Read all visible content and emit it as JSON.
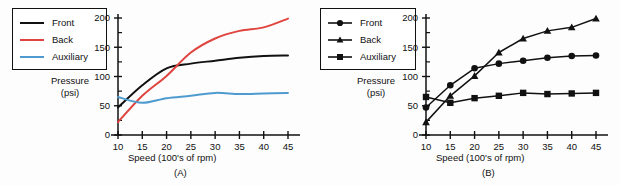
{
  "figure": {
    "background_color": "#fdfdfd",
    "panels": [
      {
        "id": "A",
        "caption": "(A)",
        "style": "colored-lines"
      },
      {
        "id": "B",
        "caption": "(B)",
        "style": "black-lines-with-markers"
      }
    ]
  },
  "chart_data": [
    {
      "type": "line",
      "panel": "A",
      "title": "",
      "caption": "(A)",
      "xlabel": "Speed (100's of rpm)",
      "ylabel": "Pressure (psi)",
      "ylabel_line1": "Pressure",
      "ylabel_line2": "(psi)",
      "x": [
        10,
        15,
        20,
        25,
        30,
        35,
        40,
        45
      ],
      "xticks": [
        "10",
        "15",
        "20",
        "25",
        "30",
        "35",
        "40",
        "45"
      ],
      "yticks": [
        "0",
        "50",
        "100",
        "150",
        "200"
      ],
      "xlim": [
        10,
        45
      ],
      "ylim": [
        0,
        200
      ],
      "grid": false,
      "legend_position": "outside-left",
      "series": [
        {
          "name": "Front",
          "values": [
            47,
            85,
            114,
            122,
            127,
            132,
            135,
            136
          ],
          "color": "#111111",
          "marker": "none"
        },
        {
          "name": "Back",
          "values": [
            22,
            67,
            101,
            141,
            165,
            178,
            184,
            199
          ],
          "color": "#E0443F",
          "marker": "none"
        },
        {
          "name": "Auxiliary",
          "values": [
            65,
            55,
            63,
            67,
            72,
            70,
            71,
            72
          ],
          "color": "#4E9BD0",
          "marker": "none"
        }
      ]
    },
    {
      "type": "line",
      "panel": "B",
      "title": "",
      "caption": "(B)",
      "xlabel": "Speed (100's of rpm)",
      "ylabel": "Pressure (psi)",
      "ylabel_line1": "Pressure",
      "ylabel_line2": "(psi)",
      "x": [
        10,
        15,
        20,
        25,
        30,
        35,
        40,
        45
      ],
      "xticks": [
        "10",
        "15",
        "20",
        "25",
        "30",
        "35",
        "40",
        "45"
      ],
      "yticks": [
        "0",
        "50",
        "100",
        "150",
        "200"
      ],
      "xlim": [
        10,
        45
      ],
      "ylim": [
        0,
        200
      ],
      "grid": false,
      "legend_position": "outside-left",
      "series": [
        {
          "name": "Front",
          "values": [
            47,
            85,
            114,
            122,
            127,
            132,
            135,
            136
          ],
          "color": "#111111",
          "marker": "circle"
        },
        {
          "name": "Back",
          "values": [
            22,
            67,
            101,
            141,
            165,
            178,
            184,
            199
          ],
          "color": "#111111",
          "marker": "triangle"
        },
        {
          "name": "Auxiliary",
          "values": [
            65,
            55,
            63,
            67,
            72,
            70,
            71,
            72
          ],
          "color": "#111111",
          "marker": "square"
        }
      ]
    }
  ]
}
